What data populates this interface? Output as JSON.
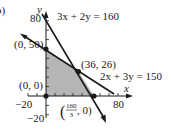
{
  "panel_label": "b)",
  "axes": {
    "x_label": "x",
    "y_label": "y",
    "x_ticks_labeled": [
      "−20",
      "80"
    ],
    "y_ticks_labeled": [
      "80",
      "−20"
    ]
  },
  "lines": [
    {
      "equation": "3x + 2y = 160",
      "color": "#1a1a1a"
    },
    {
      "equation": "2x + 3y = 150",
      "color": "#1a1a1a"
    }
  ],
  "vertices": [
    {
      "label": "(0, 0)",
      "x": 0,
      "y": 0
    },
    {
      "label": "(0, 50)",
      "x": 0,
      "y": 50
    },
    {
      "label": "(36, 26)",
      "x": 36,
      "y": 26
    },
    {
      "label_num": "160",
      "label_den": "3",
      "label_tail": ", 0)",
      "label_head": "(",
      "x": 53.33,
      "y": 0
    }
  ],
  "region": {
    "fill": "#b5b5b5",
    "description": "feasible region"
  },
  "colors": {
    "ink": "#1a1a1a",
    "shade": "#b5b5b5",
    "background": "#ffffff"
  }
}
